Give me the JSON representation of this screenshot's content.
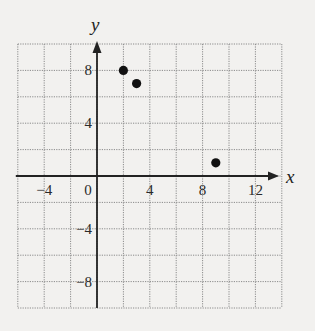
{
  "chart_data": {
    "type": "scatter",
    "title": "",
    "xlabel": "x",
    "ylabel": "y",
    "xlim": [
      -6,
      14
    ],
    "ylim": [
      -10,
      10
    ],
    "grid": true,
    "grid_step": 2,
    "x_ticks": [
      -4,
      0,
      4,
      8,
      12
    ],
    "x_tick_labels": [
      "−4",
      "0",
      "4",
      "8",
      "12"
    ],
    "y_ticks": [
      8,
      4,
      -4,
      -8
    ],
    "y_tick_labels": [
      "8",
      "4",
      "−4",
      "−8"
    ],
    "points": [
      {
        "x": 2,
        "y": 8
      },
      {
        "x": 3,
        "y": 7
      },
      {
        "x": 9,
        "y": 1
      }
    ]
  },
  "colors": {
    "background": "#f2f1ef",
    "grid": "#8a8a8a",
    "axis": "#222222",
    "point": "#111111"
  }
}
